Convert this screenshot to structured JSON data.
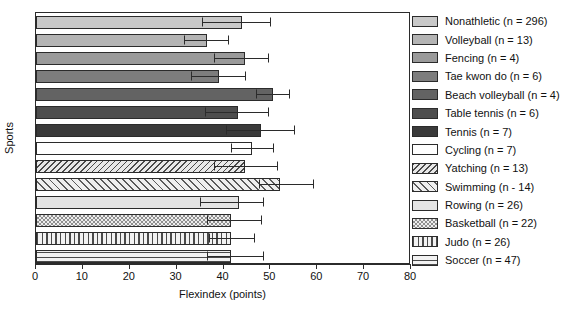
{
  "chart_data": {
    "type": "bar",
    "orientation": "horizontal",
    "title": "",
    "xlabel": "Flexindex (points)",
    "ylabel": "Sports",
    "xlim": [
      0,
      80
    ],
    "xticks": [
      0,
      10,
      20,
      30,
      40,
      50,
      60,
      70,
      80
    ],
    "grid": false,
    "legend_position": "right",
    "categories": [
      "Nonathletic",
      "Volleyball",
      "Fencing",
      "Tae kwon do",
      "Beach volleyball",
      "Table tennis",
      "Tennis",
      "Cycling",
      "Yatching",
      "Swimming",
      "Rowing",
      "Basketball",
      "Judo",
      "Soccer"
    ],
    "legend": [
      {
        "label": "Nonathletic (n = 296)",
        "n": 296,
        "fill": "#c9c9c9",
        "pattern": "solid"
      },
      {
        "label": "Volleyball (n = 13)",
        "n": 13,
        "fill": "#b4b4b4",
        "pattern": "solid"
      },
      {
        "label": "Fencing (n = 4)",
        "n": 4,
        "fill": "#9a9a9a",
        "pattern": "solid"
      },
      {
        "label": "Tae kwon do (n = 6)",
        "n": 6,
        "fill": "#7d7d7d",
        "pattern": "solid"
      },
      {
        "label": "Beach volleyball (n = 4)",
        "n": 4,
        "fill": "#636363",
        "pattern": "solid"
      },
      {
        "label": "Table tennis (n = 6)",
        "n": 6,
        "fill": "#4d4d4d",
        "pattern": "solid"
      },
      {
        "label": "Tennis (n = 7)",
        "n": 7,
        "fill": "#3a3a3a",
        "pattern": "solid"
      },
      {
        "label": "Cycling (n = 7)",
        "n": 7,
        "fill": "#ffffff",
        "pattern": "solid"
      },
      {
        "label": "Yatching (n = 13)",
        "n": 13,
        "fill": "#e8e8e8",
        "pattern": "hatch-back-dense"
      },
      {
        "label": "Swimming (n - 14)",
        "n": 14,
        "fill": "#efefef",
        "pattern": "hatch-fwd"
      },
      {
        "label": "Rowing (n = 26)",
        "n": 26,
        "fill": "#e4e4e4",
        "pattern": "speckle"
      },
      {
        "label": "Basketball (n = 22)",
        "n": 22,
        "fill": "#dcdcdc",
        "pattern": "checker"
      },
      {
        "label": "Judo (n = 26)",
        "n": 26,
        "fill": "#f2f2f2",
        "pattern": "vertical"
      },
      {
        "label": "Soccer (n = 47)",
        "n": 47,
        "fill": "#f2f2f2",
        "pattern": "horizontal"
      }
    ],
    "values": [
      44.0,
      36.5,
      44.5,
      39.0,
      50.5,
      43.0,
      48.0,
      46.0,
      44.5,
      52.0,
      43.3,
      41.5,
      41.5,
      41.5
    ],
    "err_low": [
      35.5,
      31.5,
      38.0,
      33.0,
      47.0,
      36.0,
      40.5,
      41.5,
      38.0,
      47.5,
      35.0,
      36.5,
      37.0,
      36.5
    ],
    "err_high": [
      50.0,
      41.0,
      49.5,
      44.5,
      54.0,
      49.5,
      55.0,
      50.5,
      51.5,
      59.0,
      48.5,
      48.0,
      46.5,
      48.5
    ]
  }
}
